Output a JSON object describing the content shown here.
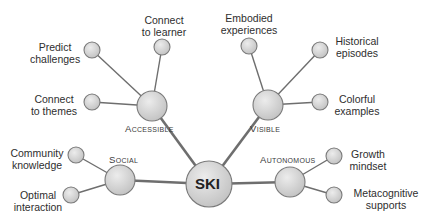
{
  "center": {
    "label": "SKI",
    "x": 209,
    "y": 184,
    "r": 23
  },
  "categories": [
    {
      "id": "accessible",
      "label": "Accessible",
      "x": 152,
      "y": 106,
      "r": 15,
      "leaves": [
        {
          "label_lines": [
            "Predict",
            "challenges"
          ],
          "x": 92,
          "y": 50
        },
        {
          "label_lines": [
            "Connect",
            "to learner"
          ],
          "x": 162,
          "y": 47
        },
        {
          "label_lines": [
            "Connect",
            "to themes"
          ],
          "x": 92,
          "y": 102
        }
      ]
    },
    {
      "id": "visible",
      "label": "Visible",
      "x": 268,
      "y": 105,
      "r": 15,
      "leaves": [
        {
          "label_lines": [
            "Embodied",
            "experiences"
          ],
          "x": 249,
          "y": 46
        },
        {
          "label_lines": [
            "Historical",
            "episodes"
          ],
          "x": 320,
          "y": 50
        },
        {
          "label_lines": [
            "Colorful",
            "examples"
          ],
          "x": 320,
          "y": 102
        }
      ]
    },
    {
      "id": "social",
      "label": "Social",
      "x": 120,
      "y": 180,
      "r": 15,
      "leaves": [
        {
          "label_lines": [
            "Community",
            "knowledge"
          ],
          "x": 76,
          "y": 155
        },
        {
          "label_lines": [
            "Optimal",
            "interaction"
          ],
          "x": 71,
          "y": 195
        }
      ]
    },
    {
      "id": "autonomous",
      "label": "Autonomous",
      "x": 290,
      "y": 182,
      "r": 15,
      "leaves": [
        {
          "label_lines": [
            "Growth",
            "mindset"
          ],
          "x": 334,
          "y": 156
        },
        {
          "label_lines": [
            "Metacognitive",
            "supports"
          ],
          "x": 334,
          "y": 195
        }
      ]
    }
  ],
  "labels": {
    "center": "SKI",
    "accessible": "Accessible",
    "visible": "Visible",
    "social": "Social",
    "autonomous": "Autonomous",
    "predict_1": "Predict",
    "predict_2": "challenges",
    "learner_1": "Connect",
    "learner_2": "to learner",
    "themes_1": "Connect",
    "themes_2": "to themes",
    "embodied_1": "Embodied",
    "embodied_2": "experiences",
    "historical_1": "Historical",
    "historical_2": "episodes",
    "colorful_1": "Colorful",
    "colorful_2": "examples",
    "community_1": "Community",
    "community_2": "knowledge",
    "optimal_1": "Optimal",
    "optimal_2": "interaction",
    "growth_1": "Growth",
    "growth_2": "mindset",
    "meta_1": "Metacognitive",
    "meta_2": "supports"
  },
  "colors": {
    "node_fill": "#d6d6d6",
    "node_stroke": "#7a7a7a",
    "edge": "#6e6e6e",
    "text": "#2e2e2e"
  }
}
